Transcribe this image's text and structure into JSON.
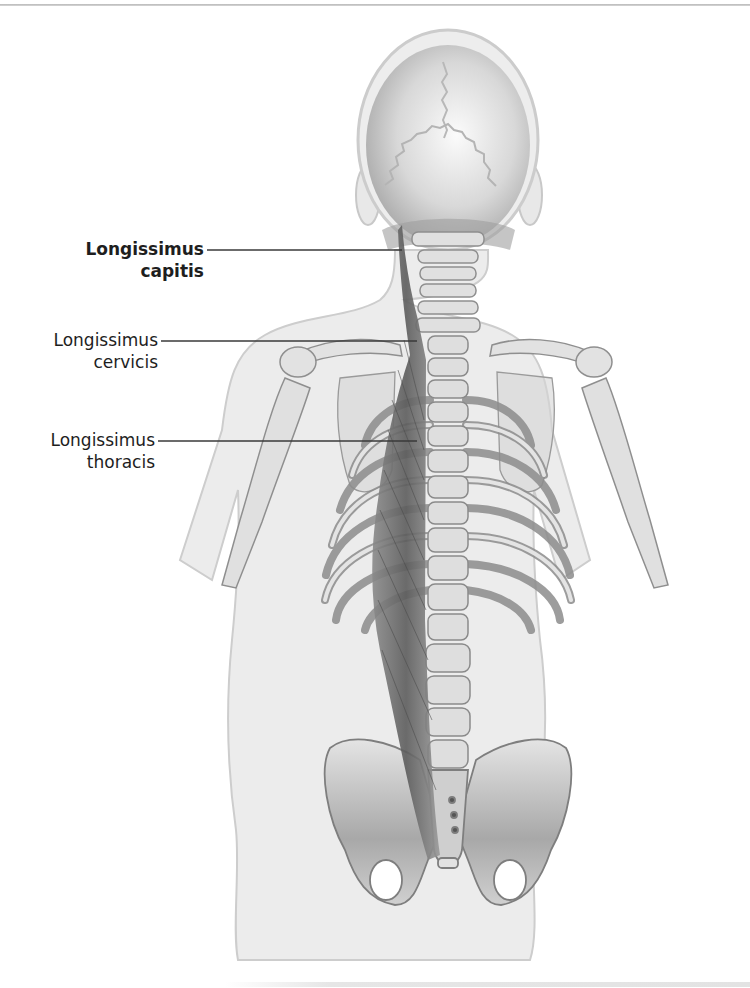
{
  "figure": {
    "colors": {
      "body_fill": "#ececec",
      "body_outline": "#c9c9c9",
      "bone_fill": "#e2e2e2",
      "bone_outline": "#8a8a8a",
      "muscle": "#6d6d6d",
      "leader_line": "#3a3a3a",
      "label_text": "#1e1e1e"
    }
  },
  "labels": [
    {
      "line1": "Longissimus",
      "line2": "capitis",
      "bold": true
    },
    {
      "line1": "Longissimus",
      "line2": "cervicis",
      "bold": false
    },
    {
      "line1": "Longissimus",
      "line2": "thoracis",
      "bold": false
    }
  ]
}
